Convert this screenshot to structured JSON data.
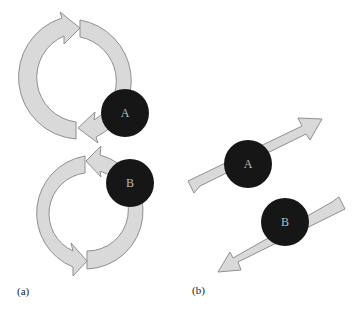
{
  "figure": {
    "panel_a": {
      "label": "(a)",
      "description": "Two particles each with circular (rotational) motion arrows",
      "particles": [
        {
          "name": "A",
          "rotation": "clockwise"
        },
        {
          "name": "B",
          "rotation": "clockwise"
        }
      ]
    },
    "panel_b": {
      "label": "(b)",
      "description": "Two particles moving linearly in opposite directions",
      "particles": [
        {
          "name": "A",
          "direction": "up-right"
        },
        {
          "name": "B",
          "direction": "down-left"
        }
      ]
    },
    "colors": {
      "arrow_fill": "#d9d9d9",
      "arrow_stroke": "#8f8f8f",
      "particle_fill": "#161616",
      "background": "#ffffff"
    }
  }
}
